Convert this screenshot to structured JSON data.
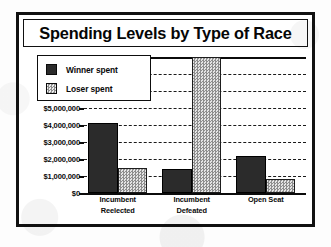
{
  "chart_data": {
    "type": "bar",
    "title": "Spending Levels by Type of Race",
    "xlabel": "",
    "ylabel": "",
    "ylim": [
      0,
      8000000
    ],
    "grid": true,
    "legend_position": "upper-left-inside",
    "categories": [
      "Incumbent Reelected",
      "Incumbent Defeated",
      "Open Seat"
    ],
    "category_lines": [
      [
        "Incumbent",
        "Reelected"
      ],
      [
        "Incumbent",
        "Defeated"
      ],
      [
        "Open Seat",
        ""
      ]
    ],
    "series": [
      {
        "name": "Winner spent",
        "color": "#2b2b2b",
        "pattern": "solid",
        "values": [
          4100000,
          1400000,
          2200000
        ]
      },
      {
        "name": "Loser spent",
        "color": "#cfcfcf",
        "pattern": "checkered",
        "values": [
          1500000,
          8000000,
          850000
        ]
      }
    ],
    "y_ticks": [
      0,
      1000000,
      2000000,
      3000000,
      4000000,
      5000000,
      6000000,
      7000000,
      8000000
    ],
    "y_tick_labels": [
      "$0",
      "$1,000,000",
      "$2,000,000",
      "$3,000,000",
      "$4,000,000",
      "$5,000,000",
      "$6,000,000",
      "$7,000,000",
      "$8,000,000"
    ]
  },
  "legend": {
    "items": [
      {
        "label": "Winner spent",
        "swatch": "solid-dark-square"
      },
      {
        "label": "Loser spent",
        "swatch": "checkered-light-square"
      }
    ]
  },
  "colors": {
    "frame": "#111111",
    "winner": "#2b2b2b",
    "loser": "#cfcfcf",
    "gridline": "#1a1a1a",
    "background": "#ffffff"
  }
}
